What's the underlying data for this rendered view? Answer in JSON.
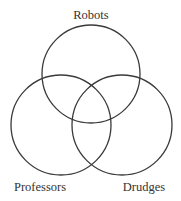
{
  "diagram": {
    "type": "venn",
    "sets": [
      {
        "id": "robots",
        "label": "Robots",
        "cx": 91,
        "cy": 74,
        "r": 49,
        "label_x": 91,
        "label_y": 19,
        "anchor": "middle"
      },
      {
        "id": "professors",
        "label": "Professors",
        "cx": 61,
        "cy": 125,
        "r": 50,
        "label_x": 40,
        "label_y": 191,
        "anchor": "middle"
      },
      {
        "id": "drudges",
        "label": "Drudges",
        "cx": 122,
        "cy": 125,
        "r": 50,
        "label_x": 144,
        "label_y": 191,
        "anchor": "middle"
      }
    ],
    "stroke_color": "#3a3a3a",
    "text_color": "#333333"
  }
}
